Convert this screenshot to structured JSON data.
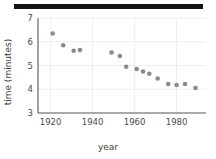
{
  "figure": {
    "top_bar_color": "#151515",
    "background": "#ffffff"
  },
  "chart_data": {
    "type": "scatter",
    "title": "",
    "xlabel": "year",
    "ylabel": "time (minutes)",
    "xlim": [
      1914,
      1994
    ],
    "ylim": [
      3,
      7
    ],
    "xticks": [
      1920,
      1940,
      1960,
      1980
    ],
    "yticks": [
      3,
      4,
      5,
      6,
      7
    ],
    "grid": true,
    "legend": false,
    "marker_color": "#8a8a8a",
    "x": [
      1921,
      1926,
      1931,
      1934,
      1949,
      1953,
      1956,
      1961,
      1964,
      1967,
      1971,
      1976,
      1980,
      1984,
      1989
    ],
    "y": [
      6.35,
      5.85,
      5.62,
      5.65,
      5.55,
      5.4,
      4.95,
      4.85,
      4.75,
      4.65,
      4.45,
      4.22,
      4.18,
      4.22,
      4.05
    ],
    "points": [
      {
        "year": 1921,
        "time": 6.35
      },
      {
        "year": 1926,
        "time": 5.85
      },
      {
        "year": 1931,
        "time": 5.62
      },
      {
        "year": 1934,
        "time": 5.65
      },
      {
        "year": 1949,
        "time": 5.55
      },
      {
        "year": 1953,
        "time": 5.4
      },
      {
        "year": 1956,
        "time": 4.95
      },
      {
        "year": 1961,
        "time": 4.85
      },
      {
        "year": 1964,
        "time": 4.75
      },
      {
        "year": 1967,
        "time": 4.65
      },
      {
        "year": 1971,
        "time": 4.45
      },
      {
        "year": 1976,
        "time": 4.22
      },
      {
        "year": 1980,
        "time": 4.18
      },
      {
        "year": 1984,
        "time": 4.22
      },
      {
        "year": 1989,
        "time": 4.05
      }
    ]
  }
}
